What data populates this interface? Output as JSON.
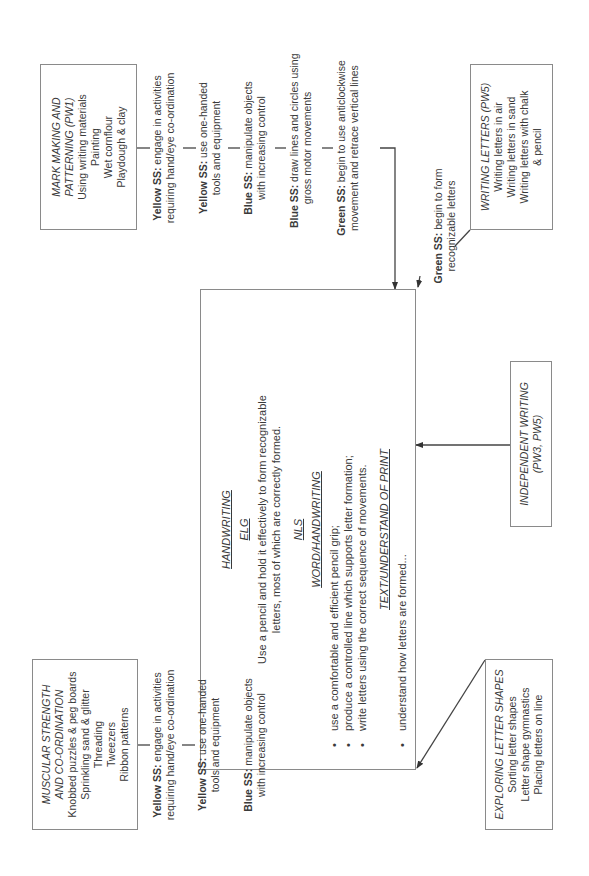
{
  "center": {
    "heading": "HANDWRITING",
    "elg_heading": "ELG",
    "elg_text_1": "Use a pencil and hold it effectively to form recognizable",
    "elg_text_2": "letters, most of which are correctly formed.",
    "nls_heading": "NLS",
    "word_heading": "WORD/HANDWRITING",
    "word_items": [
      "use a comfortable and efficient pencil grip;",
      "produce a controlled line which supports letter formation;",
      "write letters using the correct sequence of movements."
    ],
    "text_heading": "TEXT/UNDERSTAND OF PRINT",
    "text_items": [
      "understand how letters are formed..."
    ]
  },
  "mark_making": {
    "title_1": "MARK MAKING AND",
    "title_2": "PATTERNING (PW1)",
    "items": [
      "Using writing materials",
      "Painting",
      "Wet cornflour",
      "Playdough & clay"
    ]
  },
  "mark_steps": [
    {
      "color": "Yellow SS:",
      "line1": " engage in activities",
      "line2": "requiring hand/eye co-ordination"
    },
    {
      "color": "Yellow SS:",
      "line1": " use one-handed",
      "line2": "tools and equipment"
    },
    {
      "color": "Blue SS:",
      "line1": " manipulate objects",
      "line2": "with increasing control"
    },
    {
      "color": "Blue SS:",
      "line1": " draw lines and circles using",
      "line2": "gross motor movements"
    },
    {
      "color": "Green SS:",
      "line1": " begin to use anticlockwise",
      "line2": "movement and retrace vertical lines"
    }
  ],
  "writing_letters": {
    "title": "WRITING LETTERS (PW5)",
    "items": [
      "Writing letters in air",
      "Writing letters in sand",
      "Writing letters with chalk",
      "& pencil"
    ]
  },
  "writing_step": {
    "color": "Green SS:",
    "line1": " begin to form",
    "line2": "recognizable letters"
  },
  "independent": {
    "title_1": "INDEPENDENT WRITING",
    "title_2": "(PW3, PW5)"
  },
  "muscular": {
    "title_1": "MUSCULAR STRENGTH",
    "title_2": "AND CO-ORDINATION",
    "items": [
      "Knobbed puzzles & peg boards",
      "Sprinkling sand & glitter",
      "Threading",
      "Tweezers",
      "Ribbon patterns"
    ]
  },
  "muscular_steps": [
    {
      "color": "Yellow SS:",
      "line1": " engage in activities",
      "line2": "requiring hand/eye co-ordination"
    },
    {
      "color": "Yellow SS:",
      "line1": " use one-handed",
      "line2": "tools and equipment"
    },
    {
      "color": "Blue SS:",
      "line1": " manipulate objects",
      "line2": "with increasing control"
    }
  ],
  "exploring": {
    "title": "EXPLORING LETTER SHAPES",
    "items": [
      "Sorting letter shapes",
      "Letter shape gymnastics",
      "Placing letters on line"
    ]
  }
}
